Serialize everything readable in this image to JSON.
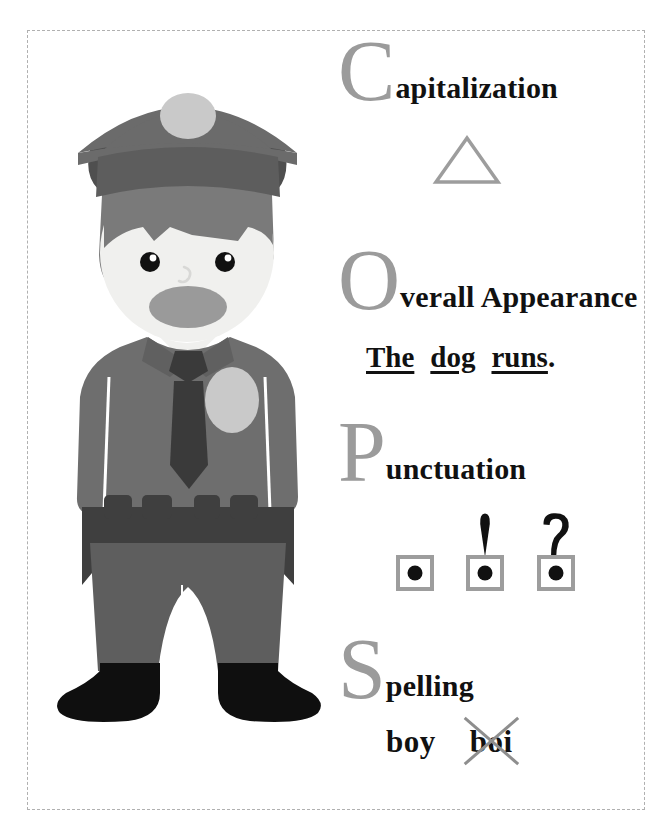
{
  "poster": {
    "title": "COPS editing checklist poster",
    "background_color": "#ffffff",
    "border_color": "#b0b0b0"
  },
  "illustration": {
    "name": "police-officer",
    "colors": {
      "cap": "#6b6b6b",
      "cap_visor": "#4f4f4f",
      "cap_badge": "#c9c9c9",
      "hair": "#7a7a7a",
      "skin": "#f0f0ee",
      "eyes": "#111111",
      "mouth": "#9a9a9a",
      "shirt": "#6e6e6e",
      "tie": "#3a3a3a",
      "chest_badge": "#c9c9c9",
      "belt": "#3f3f3f",
      "trousers": "#5e5e5e",
      "shoes": "#0f0f0f"
    }
  },
  "accent": {
    "letter_gray": "#9b9b9b",
    "shape_gray": "#9d9d9d",
    "text_black": "#111111"
  },
  "acronym": {
    "items": [
      {
        "letter": "C",
        "rest": "apitalization",
        "full_word": "Capitalization",
        "example_type": "triangle",
        "example_label": "triangle-shape"
      },
      {
        "letter": "O",
        "rest": "verall Appearance",
        "full_word": "Overall Appearance",
        "example_type": "sentence",
        "example_words": [
          "The",
          "dog",
          "runs"
        ],
        "example_punctuation": ".",
        "example_text": "The  dog  runs."
      },
      {
        "letter": "P",
        "rest": "unctuation",
        "full_word": "Punctuation",
        "example_type": "punctuation-marks",
        "marks": [
          {
            "name": "period",
            "glyph": "."
          },
          {
            "name": "exclamation-mark",
            "glyph": "!"
          },
          {
            "name": "question-mark",
            "glyph": "?"
          }
        ]
      },
      {
        "letter": "S",
        "rest": "pelling",
        "full_word": "Spelling",
        "example_type": "spelling-words",
        "correct_word": "boy",
        "incorrect_word": "boi"
      }
    ]
  }
}
